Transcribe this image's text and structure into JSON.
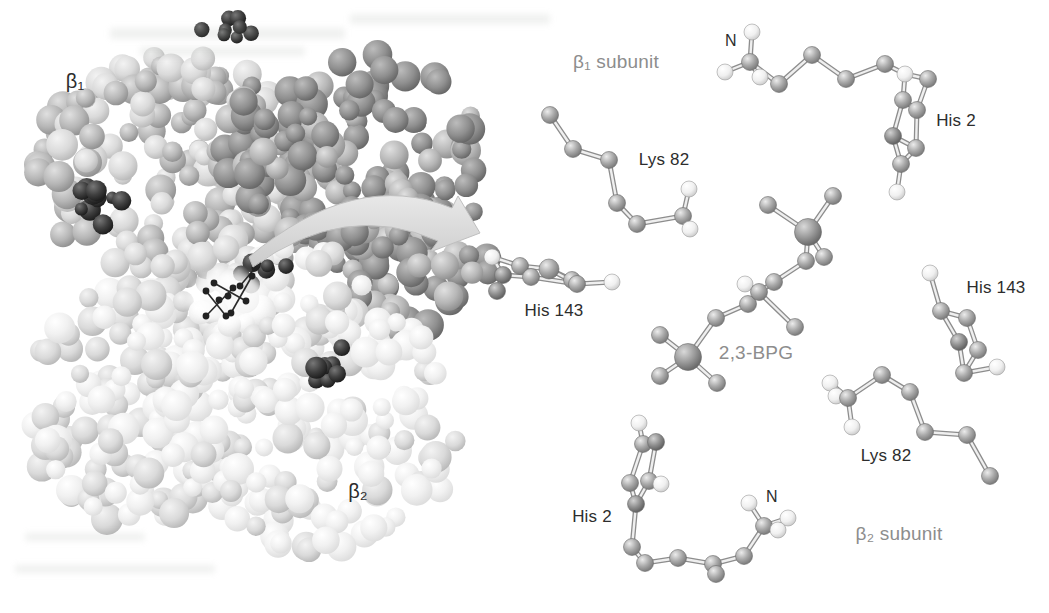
{
  "figure": {
    "left_model": {
      "beta1_label": "β₁",
      "beta2_label": "β₂"
    },
    "detail_view": {
      "beta1_subunit_label": "β₁ subunit",
      "beta2_subunit_label": "β₂ subunit",
      "bpg_label": "2,3-BPG",
      "beta1": {
        "n_terminus": "N",
        "his2": "His 2",
        "lys82": "Lys 82",
        "his143": "His 143"
      },
      "beta2": {
        "n_terminus": "N",
        "his2": "His 2",
        "lys82": "Lys 82",
        "his143": "His 143"
      }
    },
    "colors": {
      "background": "#ffffff",
      "label_dark": "#2d2d2d",
      "label_gray": "#8d8d8d",
      "protein_light": "#f0f0f0",
      "protein_mid": "#b6b6b6",
      "protein_dark": "#8f8f8f",
      "heme_dark": "#141414",
      "arrow_gray": "#d9d9d9"
    }
  }
}
